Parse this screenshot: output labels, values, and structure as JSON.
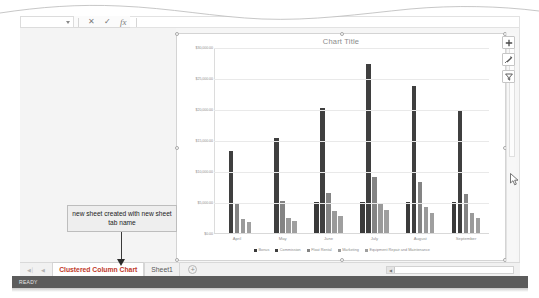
{
  "window": {
    "status_text": "READY"
  },
  "formula_bar": {
    "name_box_value": "",
    "formula_value": "",
    "cancel_icon": "cancel-icon",
    "enter_icon": "enter-icon",
    "fx_label": "fx"
  },
  "chart": {
    "title": "Chart Title",
    "buttons": [
      {
        "name": "chart-elements-button",
        "icon": "plus-icon",
        "label": "+"
      },
      {
        "name": "chart-styles-button",
        "icon": "brush-icon",
        "label": "Chart Styles"
      },
      {
        "name": "chart-filters-button",
        "icon": "filter-icon",
        "label": "Chart Filters"
      }
    ]
  },
  "chart_data": {
    "type": "bar",
    "title": "Chart Title",
    "xlabel": "",
    "ylabel": "",
    "ylim": [
      0,
      30000
    ],
    "yticks": [
      0,
      5000,
      10000,
      15000,
      20000,
      25000,
      30000
    ],
    "ytick_labels": [
      "$0.00",
      "$5,000.00",
      "$10,000.00",
      "$15,000.00",
      "$20,000.00",
      "$25,000.00",
      "$30,000.00"
    ],
    "grid": true,
    "legend_position": "bottom",
    "categories": [
      "April",
      "May",
      "June",
      "July",
      "August",
      "September"
    ],
    "series": [
      {
        "name": "Bonus",
        "color": "#3a3a3a",
        "values": [
          0,
          0,
          5000,
          5000,
          5000,
          5000
        ]
      },
      {
        "name": "Commission",
        "color": "#3f3f3f",
        "values": [
          13300,
          15400,
          20200,
          27200,
          23700,
          19700
        ]
      },
      {
        "name": "Float Rental",
        "color": "#848484",
        "values": [
          4700,
          5100,
          6500,
          9100,
          8200,
          6300
        ]
      },
      {
        "name": "Marketing",
        "color": "#9a9a9a",
        "values": [
          2200,
          2400,
          3500,
          4700,
          4200,
          3300
        ]
      },
      {
        "name": "Equipment Repair and Maintenance",
        "color": "#9f9f9f",
        "values": [
          1700,
          1900,
          2700,
          3700,
          3200,
          2500
        ]
      }
    ]
  },
  "callout": {
    "text": "new sheet created with new sheet tab name"
  },
  "sheet_tabs": {
    "nav_first": "◀│",
    "nav_prev": "◀",
    "nav_next": "▶",
    "nav_last": "│▶",
    "tabs": [
      {
        "label": "Clustered Column Chart",
        "active": true
      },
      {
        "label": "Sheet1",
        "active": false
      }
    ],
    "add_sheet_label": "+"
  },
  "colors": {
    "accent_tab": "#c0392b",
    "status_bar": "#5c5c5c",
    "bar_dark": "#3a3a3a",
    "bar_mid": "#848484",
    "bar_light": "#9f9f9f"
  }
}
